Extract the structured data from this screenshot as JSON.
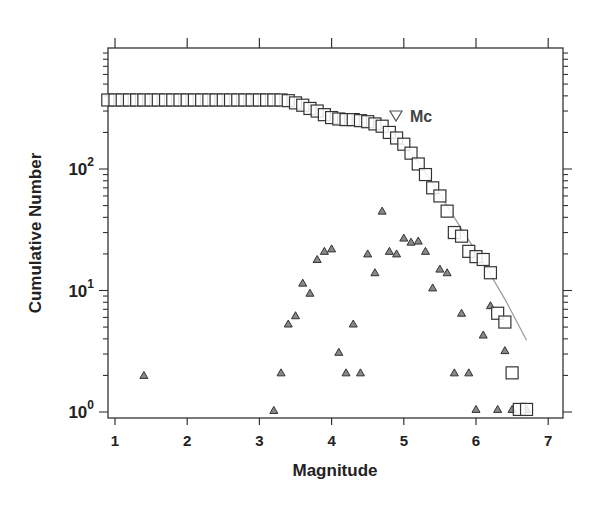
{
  "chart_data": {
    "type": "scatter",
    "title": "",
    "xlabel": "Magnitude",
    "ylabel": "Cumulative Number",
    "xlim": [
      0.9,
      7.1
    ],
    "ylim_log10": [
      -0.05,
      2.98
    ],
    "yscale": "log",
    "grid": false,
    "xticks": [
      1,
      2,
      3,
      4,
      5,
      6,
      7
    ],
    "yticks": [
      {
        "value": 1,
        "base": "10",
        "exp": "0"
      },
      {
        "value": 10,
        "base": "10",
        "exp": "1"
      },
      {
        "value": 100,
        "base": "10",
        "exp": "2"
      }
    ],
    "annotations": [
      {
        "text": "Mc",
        "marker": "inverted-triangle",
        "x": 4.92,
        "y": 265
      }
    ],
    "series": [
      {
        "name": "Cumulative number",
        "marker": "open-square",
        "x": [
          0.9,
          1.0,
          1.1,
          1.2,
          1.3,
          1.4,
          1.5,
          1.6,
          1.7,
          1.8,
          1.9,
          2.0,
          2.1,
          2.2,
          2.3,
          2.4,
          2.5,
          2.6,
          2.7,
          2.8,
          2.9,
          3.0,
          3.1,
          3.2,
          3.3,
          3.4,
          3.5,
          3.6,
          3.7,
          3.8,
          3.9,
          4.0,
          4.1,
          4.2,
          4.3,
          4.4,
          4.5,
          4.6,
          4.7,
          4.8,
          4.9,
          5.0,
          5.1,
          5.2,
          5.3,
          5.4,
          5.5,
          5.6,
          5.7,
          5.8,
          5.9,
          6.0,
          6.1,
          6.2,
          6.3,
          6.4,
          6.5,
          6.6,
          6.7
        ],
        "values": [
          370,
          370,
          370,
          370,
          370,
          370,
          370,
          370,
          370,
          370,
          370,
          370,
          370,
          370,
          370,
          370,
          370,
          370,
          370,
          370,
          370,
          370,
          370,
          370,
          370,
          365,
          350,
          335,
          315,
          300,
          280,
          265,
          258,
          255,
          255,
          250,
          245,
          235,
          225,
          200,
          180,
          160,
          135,
          110,
          90,
          70,
          60,
          45,
          30,
          28,
          21,
          19,
          18,
          14,
          6.5,
          5.5,
          2.1,
          1.05,
          1.05
        ]
      },
      {
        "name": "Non-cumulative number",
        "marker": "small-filled-triangle",
        "x": [
          1.4,
          3.2,
          3.3,
          3.4,
          3.5,
          3.6,
          3.7,
          3.8,
          3.9,
          4.0,
          4.1,
          4.2,
          4.3,
          4.4,
          4.5,
          4.6,
          4.7,
          4.8,
          4.9,
          5.0,
          5.1,
          5.2,
          5.3,
          5.4,
          5.5,
          5.6,
          5.7,
          5.8,
          5.9,
          6.0,
          6.1,
          6.2,
          6.3,
          6.4,
          6.5,
          6.7
        ],
        "values": [
          2,
          1.03,
          2.1,
          5.3,
          6.2,
          11.5,
          9.5,
          18,
          21,
          22,
          3.1,
          2.1,
          5.3,
          2.1,
          20,
          14,
          45,
          21,
          20,
          27,
          25,
          25.5,
          21,
          10.5,
          15,
          14,
          2.1,
          6.5,
          2.1,
          1.05,
          4.3,
          7.5,
          1.05,
          3.2,
          1.05,
          1.05
        ]
      },
      {
        "name": "Gutenberg-Richter fit",
        "marker": "line",
        "x": [
          4.9,
          5.2,
          5.5,
          5.8,
          6.1,
          6.4,
          6.7
        ],
        "values": [
          185,
          115,
          62,
          32,
          17,
          8.5,
          3.9
        ]
      }
    ]
  },
  "colors": {
    "axis": "#333333",
    "square": "#333333",
    "triangle_fill": "#888888",
    "triangle_stroke": "#333333",
    "fit_line": "#999999",
    "text": "#222222"
  }
}
